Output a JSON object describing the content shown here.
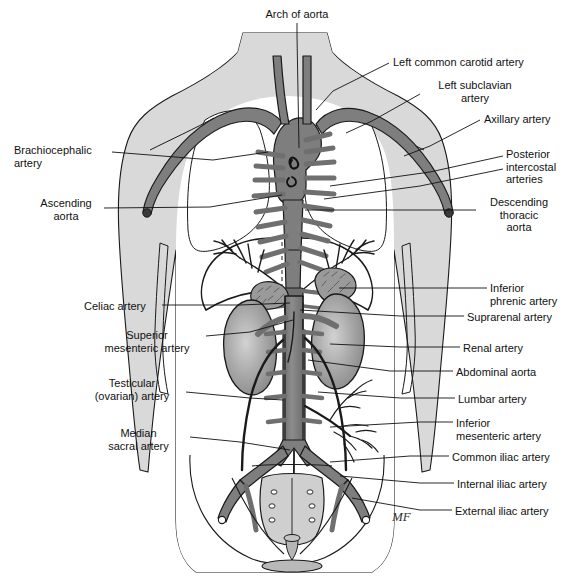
{
  "figure": {
    "signature": "MF",
    "colors": {
      "artery_fill": "#808080",
      "artery_fill_dark": "#6e6e6e",
      "artery_stroke": "#1a1a1a",
      "body_fill": "#d9d9d9",
      "body_stroke": "#1a1a1a",
      "organ_fill": "#a8a8a8",
      "background": "#ffffff",
      "leader_line": "#111111",
      "text": "#111111"
    }
  },
  "labels": [
    {
      "id": "arch-of-aorta",
      "text": "Arch of aorta",
      "x": 252,
      "y": 8,
      "align": "c",
      "width": 90
    },
    {
      "id": "left-common-carotid",
      "text": "Left common carotid artery",
      "x": 393,
      "y": 56,
      "align": "l",
      "width": 170
    },
    {
      "id": "left-subclavian",
      "text": "Left subclavian\nartery",
      "x": 425,
      "y": 79,
      "align": "c",
      "width": 100
    },
    {
      "id": "axillary-artery",
      "text": "Axillary artery",
      "x": 484,
      "y": 113,
      "align": "l",
      "width": 90
    },
    {
      "id": "brachiocephalic-artery",
      "text": "Brachiocephalic\nartery",
      "x": 14,
      "y": 144,
      "align": "l",
      "width": 95
    },
    {
      "id": "posterior-intercostal",
      "text": "Posterior\nintercostal\narteries",
      "x": 506,
      "y": 148,
      "align": "l",
      "width": 70
    },
    {
      "id": "ascending-aorta",
      "text": "Ascending\naorta",
      "x": 31,
      "y": 197,
      "align": "c",
      "width": 70
    },
    {
      "id": "descending-thoracic-aorta",
      "text": "Descending\nthoracic\naorta",
      "x": 479,
      "y": 196,
      "align": "c",
      "width": 80
    },
    {
      "id": "inferior-phrenic-artery",
      "text": "Inferior\nphrenic artery",
      "x": 490,
      "y": 282,
      "align": "l",
      "width": 86
    },
    {
      "id": "celiac-artery",
      "text": "Celiac artery",
      "x": 84,
      "y": 300,
      "align": "l",
      "width": 75
    },
    {
      "id": "suprarenal-artery",
      "text": "Suprarenal artery",
      "x": 467,
      "y": 311,
      "align": "l",
      "width": 105
    },
    {
      "id": "superior-mesenteric",
      "text": "Superior\nmesenteric artery",
      "x": 92,
      "y": 329,
      "align": "c",
      "width": 110
    },
    {
      "id": "renal-artery",
      "text": "Renal artery",
      "x": 463,
      "y": 342,
      "align": "l",
      "width": 80
    },
    {
      "id": "abdominal-aorta",
      "text": "Abdominal aorta",
      "x": 456,
      "y": 366,
      "align": "l",
      "width": 100
    },
    {
      "id": "testicular-ovarian",
      "text": "Testicular\n(ovarian) artery",
      "x": 82,
      "y": 377,
      "align": "c",
      "width": 100
    },
    {
      "id": "lumbar-artery",
      "text": "Lumbar artery",
      "x": 458,
      "y": 393,
      "align": "l",
      "width": 88
    },
    {
      "id": "inferior-mesenteric",
      "text": "Inferior\nmesenteric artery",
      "x": 456,
      "y": 417,
      "align": "l",
      "width": 100
    },
    {
      "id": "median-sacral-artery",
      "text": "Median\nsacral artery",
      "x": 91,
      "y": 427,
      "align": "c",
      "width": 95
    },
    {
      "id": "common-iliac-artery",
      "text": "Common iliac artery",
      "x": 452,
      "y": 451,
      "align": "l",
      "width": 115
    },
    {
      "id": "internal-iliac-artery",
      "text": "Internal iliac artery",
      "x": 457,
      "y": 478,
      "align": "l",
      "width": 105
    },
    {
      "id": "external-iliac-artery",
      "text": "External iliac artery",
      "x": 455,
      "y": 505,
      "align": "l",
      "width": 110
    }
  ],
  "leaders": [
    {
      "id": "leader-arch-of-aorta",
      "points": "297,23 297,36 299,148"
    },
    {
      "id": "leader-left-common-carotid",
      "points": "389,63 333,91 316,110"
    },
    {
      "id": "leader-left-subclavian",
      "points": "420,94 372,121 346,133"
    },
    {
      "id": "leader-axillary-artery",
      "points": "480,120 430,146 404,156"
    },
    {
      "id": "leader-brachiocephalic",
      "points": "112,152 213,160 268,152"
    },
    {
      "id": "leader-posterior-intercostal-1",
      "points": "503,156 430,172 330,186"
    },
    {
      "id": "leader-posterior-intercostal-2",
      "points": "503,169 420,186 324,199"
    },
    {
      "id": "leader-ascending-aorta",
      "points": "104,208 210,207 282,195"
    },
    {
      "id": "leader-descending-thoracic-aorta",
      "points": "476,210 400,210 305,210"
    },
    {
      "id": "leader-inferior-phrenic",
      "points": "487,288 420,288 339,288"
    },
    {
      "id": "leader-celiac-artery",
      "points": "162,305 240,305 290,303"
    },
    {
      "id": "leader-suprarenal-artery",
      "points": "464,316 400,316 300,310"
    },
    {
      "id": "leader-superior-mesenteric",
      "points": "206,336 250,332 293,320"
    },
    {
      "id": "leader-renal-artery",
      "points": "460,347 400,347 330,344"
    },
    {
      "id": "leader-abdominal-aorta",
      "points": "453,371 390,371 308,360"
    },
    {
      "id": "leader-testicular-ovarian",
      "points": "186,392 250,398 283,400"
    },
    {
      "id": "leader-lumbar-artery",
      "points": "455,398 400,398 318,392"
    },
    {
      "id": "leader-inferior-mesenteric",
      "points": "453,422 420,422 330,427"
    },
    {
      "id": "leader-median-sacral",
      "points": "190,437 240,442 290,450"
    },
    {
      "id": "leader-common-iliac",
      "points": "449,456 410,456 330,462"
    },
    {
      "id": "leader-internal-iliac",
      "points": "454,483 420,483 340,476"
    },
    {
      "id": "leader-external-iliac",
      "points": "452,510 420,510 352,498"
    }
  ]
}
